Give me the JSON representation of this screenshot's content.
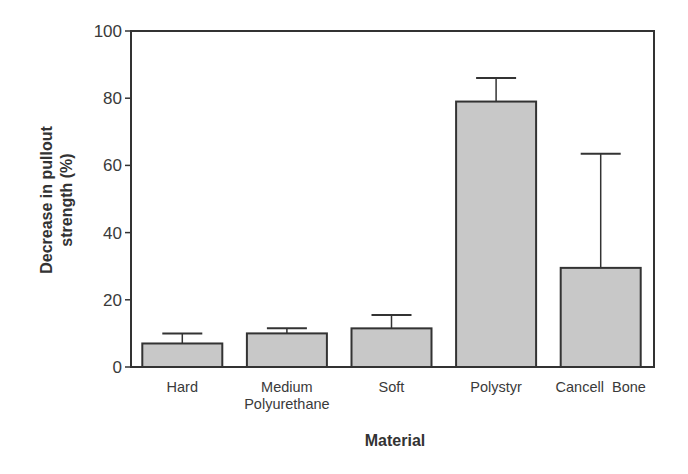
{
  "chart_data": {
    "type": "bar",
    "title": "",
    "xlabel": "Material",
    "ylabel": "Decrease in pullout strength (%)",
    "ylabel_lines": [
      "Decrease in pullout",
      "strength (%)"
    ],
    "ylim": [
      0,
      100
    ],
    "yticks": [
      0,
      20,
      40,
      60,
      80,
      100
    ],
    "grid": false,
    "legend": null,
    "categories": [
      "Hard",
      "Medium Polyurethane",
      "Soft",
      "Polystyr",
      "Cancell Bone"
    ],
    "category_label_lines": [
      [
        "Hard"
      ],
      [
        "Medium",
        "Polyurethane"
      ],
      [
        "Soft"
      ],
      [
        "Polystyr"
      ],
      [
        "Cancell  Bone"
      ]
    ],
    "values": [
      7,
      10,
      11.5,
      79,
      29.5
    ],
    "error_upper": [
      3,
      1.5,
      4,
      7,
      34
    ],
    "bar_color": "#c8c8c8",
    "edge_color": "#333333"
  },
  "axes": {
    "ytick_labels": [
      "0",
      "20",
      "40",
      "60",
      "80",
      "100"
    ]
  }
}
